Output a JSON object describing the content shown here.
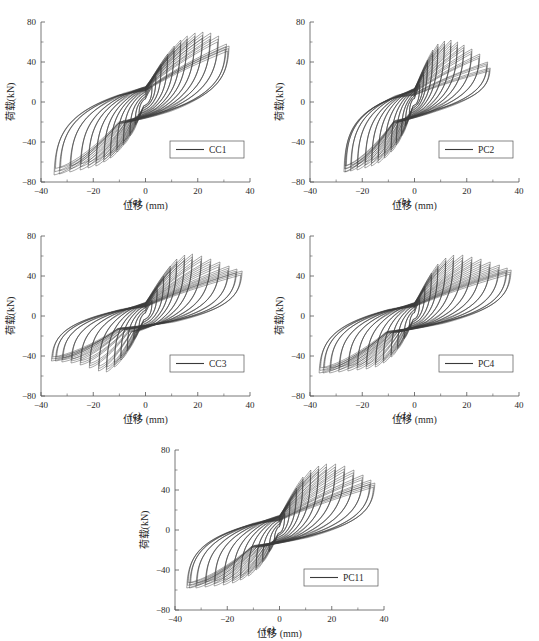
{
  "figure": {
    "background_color": "#ffffff",
    "curve_color": "#3a3a3a",
    "axis_color": "#555555",
    "panel_count": 5
  },
  "panels": [
    {
      "id": "a",
      "caption": "(a)",
      "legend": "CC1"
    },
    {
      "id": "b",
      "caption": "(b)",
      "legend": "PC2"
    },
    {
      "id": "c",
      "caption": "(c)",
      "legend": "CC3"
    },
    {
      "id": "d",
      "caption": "(d )",
      "legend": "PC4"
    },
    {
      "id": "e",
      "caption": "(e)",
      "legend": "PC11"
    }
  ],
  "chart_data": [
    {
      "type": "line",
      "title": "",
      "subtitle": "",
      "panel": "a",
      "legend_entries": [
        "CC1"
      ],
      "legend_position": "lower-right",
      "grid": false,
      "xlabel": "位移 (mm)",
      "ylabel": "荷载(kN)",
      "xlim": [
        -40,
        40
      ],
      "ylim": [
        -80,
        80
      ],
      "xticks": [
        -40,
        -20,
        0,
        20,
        40
      ],
      "yticks": [
        -80,
        -40,
        0,
        40,
        80
      ],
      "xtick_labels": [
        "-40",
        "-20",
        "0",
        "20",
        "40"
      ],
      "ytick_labels": [
        "-80",
        "-40",
        "0",
        "40",
        "80"
      ],
      "description": "Pinched hysteresis loops, load vs displacement, cyclic loading",
      "cycles": [
        {
          "peak_disp": 2.5,
          "peak_load": 16,
          "neg_disp": -2.5,
          "neg_load": -14
        },
        {
          "peak_disp": 4.0,
          "peak_load": 26,
          "neg_disp": -4.0,
          "neg_load": -23
        },
        {
          "peak_disp": 6.0,
          "peak_load": 38,
          "neg_disp": -6.0,
          "neg_load": -34
        },
        {
          "peak_disp": 8.5,
          "peak_load": 48,
          "neg_disp": -8.5,
          "neg_load": -43
        },
        {
          "peak_disp": 11.0,
          "peak_load": 56,
          "neg_disp": -11.0,
          "neg_load": -50
        },
        {
          "peak_disp": 13.5,
          "peak_load": 62,
          "neg_disp": -13.5,
          "neg_load": -56
        },
        {
          "peak_disp": 16.0,
          "peak_load": 66,
          "neg_disp": -16.0,
          "neg_load": -60
        },
        {
          "peak_disp": 19.0,
          "peak_load": 69,
          "neg_disp": -19.0,
          "neg_load": -64
        },
        {
          "peak_disp": 22.0,
          "peak_load": 70,
          "neg_disp": -22.0,
          "neg_load": -66
        },
        {
          "peak_disp": 25.0,
          "peak_load": 69,
          "neg_disp": -25.0,
          "neg_load": -68
        },
        {
          "peak_disp": 28.0,
          "peak_load": 66,
          "neg_disp": -29.0,
          "neg_load": -70
        },
        {
          "peak_disp": 31.0,
          "peak_load": 58,
          "neg_disp": -33.0,
          "neg_load": -72
        },
        {
          "peak_disp": 32.0,
          "peak_load": 56,
          "neg_disp": -35.0,
          "neg_load": -73
        }
      ],
      "max_positive_load": 70,
      "max_negative_load": -73,
      "max_positive_disp": 32,
      "max_negative_disp": -35
    },
    {
      "type": "line",
      "title": "",
      "panel": "b",
      "legend_entries": [
        "PC2"
      ],
      "legend_position": "lower-right",
      "grid": false,
      "xlabel": "位移 (mm)",
      "ylabel": "荷载(kN)",
      "xlim": [
        -40,
        40
      ],
      "ylim": [
        -80,
        80
      ],
      "xticks": [
        -40,
        -20,
        0,
        20,
        40
      ],
      "yticks": [
        -80,
        -40,
        0,
        40,
        80
      ],
      "xtick_labels": [
        "-40",
        "-20",
        "0",
        "20",
        "40"
      ],
      "ytick_labels": [
        "-80",
        "-40",
        "0",
        "40",
        "80"
      ],
      "description": "Pinched hysteresis loops, load vs displacement, cyclic loading",
      "cycles": [
        {
          "peak_disp": 2.0,
          "peak_load": 18,
          "neg_disp": -2.0,
          "neg_load": -14
        },
        {
          "peak_disp": 3.5,
          "peak_load": 30,
          "neg_disp": -3.5,
          "neg_load": -24
        },
        {
          "peak_disp": 5.0,
          "peak_load": 42,
          "neg_disp": -5.0,
          "neg_load": -34
        },
        {
          "peak_disp": 7.0,
          "peak_load": 52,
          "neg_disp": -7.0,
          "neg_load": -43
        },
        {
          "peak_disp": 9.0,
          "peak_load": 58,
          "neg_disp": -9.0,
          "neg_load": -50
        },
        {
          "peak_disp": 11.5,
          "peak_load": 61,
          "neg_disp": -11.5,
          "neg_load": -56
        },
        {
          "peak_disp": 14.0,
          "peak_load": 62,
          "neg_disp": -14.0,
          "neg_load": -61
        },
        {
          "peak_disp": 16.5,
          "peak_load": 60,
          "neg_disp": -16.5,
          "neg_load": -64
        },
        {
          "peak_disp": 19.0,
          "peak_load": 57,
          "neg_disp": -19.0,
          "neg_load": -66
        },
        {
          "peak_disp": 22.0,
          "peak_load": 53,
          "neg_disp": -22.0,
          "neg_load": -68
        },
        {
          "peak_disp": 25.0,
          "peak_load": 48,
          "neg_disp": -24.5,
          "neg_load": -69
        },
        {
          "peak_disp": 28.0,
          "peak_load": 40,
          "neg_disp": -26.5,
          "neg_load": -70
        },
        {
          "peak_disp": 29.0,
          "peak_load": 34,
          "neg_disp": -27.0,
          "neg_load": -70
        }
      ],
      "max_positive_load": 62,
      "max_negative_load": -70,
      "max_positive_disp": 29,
      "max_negative_disp": -27
    },
    {
      "type": "line",
      "title": "",
      "panel": "c",
      "legend_entries": [
        "CC3"
      ],
      "legend_position": "lower-right",
      "grid": false,
      "xlabel": "位移 (mm)",
      "ylabel": "荷载(kN)",
      "xlim": [
        -40,
        40
      ],
      "ylim": [
        -80,
        80
      ],
      "xticks": [
        -40,
        -20,
        0,
        20,
        40
      ],
      "yticks": [
        -80,
        -40,
        0,
        40,
        80
      ],
      "xtick_labels": [
        "-40",
        "-20",
        "0",
        "20",
        "40"
      ],
      "ytick_labels": [
        "-80",
        "-40",
        "0",
        "40",
        "80"
      ],
      "description": "Pinched hysteresis loops, load vs displacement, cyclic loading",
      "cycles": [
        {
          "peak_disp": 2.5,
          "peak_load": 16,
          "neg_disp": -2.5,
          "neg_load": -14
        },
        {
          "peak_disp": 4.5,
          "peak_load": 28,
          "neg_disp": -4.5,
          "neg_load": -24
        },
        {
          "peak_disp": 7.0,
          "peak_load": 40,
          "neg_disp": -7.0,
          "neg_load": -35
        },
        {
          "peak_disp": 9.5,
          "peak_load": 50,
          "neg_disp": -9.5,
          "neg_load": -44
        },
        {
          "peak_disp": 12.0,
          "peak_load": 57,
          "neg_disp": -12.0,
          "neg_load": -51
        },
        {
          "peak_disp": 15.0,
          "peak_load": 61,
          "neg_disp": -15.0,
          "neg_load": -56
        },
        {
          "peak_disp": 18.0,
          "peak_load": 62,
          "neg_disp": -18.0,
          "neg_load": -55
        },
        {
          "peak_disp": 21.5,
          "peak_load": 60,
          "neg_disp": -21.5,
          "neg_load": -52
        },
        {
          "peak_disp": 25.0,
          "peak_load": 57,
          "neg_disp": -25.0,
          "neg_load": -49
        },
        {
          "peak_disp": 28.5,
          "peak_load": 54,
          "neg_disp": -28.5,
          "neg_load": -47
        },
        {
          "peak_disp": 32.0,
          "peak_load": 50,
          "neg_disp": -32.0,
          "neg_load": -46
        },
        {
          "peak_disp": 35.0,
          "peak_load": 47,
          "neg_disp": -34.5,
          "neg_load": -45
        },
        {
          "peak_disp": 37.0,
          "peak_load": 45,
          "neg_disp": -36.0,
          "neg_load": -45
        }
      ],
      "max_positive_load": 62,
      "max_negative_load": -56,
      "max_positive_disp": 37,
      "max_negative_disp": -36
    },
    {
      "type": "line",
      "title": "",
      "panel": "d",
      "legend_entries": [
        "PC4"
      ],
      "legend_position": "lower-right",
      "grid": false,
      "xlabel": "位移 (mm)",
      "ylabel": "荷载(kN)",
      "xlim": [
        -40,
        40
      ],
      "ylim": [
        -80,
        80
      ],
      "xticks": [
        -40,
        -20,
        0,
        20,
        40
      ],
      "yticks": [
        -80,
        -40,
        0,
        40,
        80
      ],
      "xtick_labels": [
        "-40",
        "-20",
        "0",
        "20",
        "40"
      ],
      "ytick_labels": [
        "-80",
        "-40",
        "0",
        "40",
        "80"
      ],
      "description": "Pinched hysteresis loops, load vs displacement, cyclic loading",
      "cycles": [
        {
          "peak_disp": 2.0,
          "peak_load": 17,
          "neg_disp": -2.0,
          "neg_load": -13
        },
        {
          "peak_disp": 4.0,
          "peak_load": 30,
          "neg_disp": -4.0,
          "neg_load": -23
        },
        {
          "peak_disp": 6.5,
          "peak_load": 43,
          "neg_disp": -6.5,
          "neg_load": -33
        },
        {
          "peak_disp": 9.0,
          "peak_load": 52,
          "neg_disp": -9.0,
          "neg_load": -41
        },
        {
          "peak_disp": 12.0,
          "peak_load": 58,
          "neg_disp": -12.0,
          "neg_load": -47
        },
        {
          "peak_disp": 15.0,
          "peak_load": 61,
          "neg_disp": -15.0,
          "neg_load": -51
        },
        {
          "peak_disp": 18.5,
          "peak_load": 61,
          "neg_disp": -18.5,
          "neg_load": -53
        },
        {
          "peak_disp": 22.0,
          "peak_load": 59,
          "neg_disp": -22.0,
          "neg_load": -54
        },
        {
          "peak_disp": 25.5,
          "peak_load": 57,
          "neg_disp": -25.5,
          "neg_load": -55
        },
        {
          "peak_disp": 29.0,
          "peak_load": 54,
          "neg_disp": -29.0,
          "neg_load": -56
        },
        {
          "peak_disp": 32.5,
          "peak_load": 51,
          "neg_disp": -32.5,
          "neg_load": -57
        },
        {
          "peak_disp": 35.5,
          "peak_load": 48,
          "neg_disp": -35.0,
          "neg_load": -57
        },
        {
          "peak_disp": 37.0,
          "peak_load": 46,
          "neg_disp": -36.5,
          "neg_load": -57
        }
      ],
      "max_positive_load": 61,
      "max_negative_load": -57,
      "max_positive_disp": 37,
      "max_negative_disp": -36.5
    },
    {
      "type": "line",
      "title": "",
      "panel": "e",
      "legend_entries": [
        "PC11"
      ],
      "legend_position": "lower-right",
      "grid": false,
      "xlabel": "位移 (mm)",
      "ylabel": "荷载(kN)",
      "xlim": [
        -40,
        40
      ],
      "ylim": [
        -80,
        80
      ],
      "xticks": [
        -40,
        -20,
        0,
        20,
        40
      ],
      "yticks": [
        -80,
        -40,
        0,
        40,
        80
      ],
      "xtick_labels": [
        "-40",
        "-20",
        "0",
        "20",
        "40"
      ],
      "ytick_labels": [
        "-80",
        "-40",
        "0",
        "40",
        "80"
      ],
      "description": "Pinched hysteresis loops, load vs displacement, cyclic loading",
      "cycles": [
        {
          "peak_disp": 2.0,
          "peak_load": 17,
          "neg_disp": -2.0,
          "neg_load": -13
        },
        {
          "peak_disp": 4.0,
          "peak_load": 29,
          "neg_disp": -4.0,
          "neg_load": -22
        },
        {
          "peak_disp": 6.5,
          "peak_load": 42,
          "neg_disp": -6.5,
          "neg_load": -32
        },
        {
          "peak_disp": 9.0,
          "peak_load": 53,
          "neg_disp": -9.0,
          "neg_load": -40
        },
        {
          "peak_disp": 12.0,
          "peak_load": 60,
          "neg_disp": -12.0,
          "neg_load": -46
        },
        {
          "peak_disp": 15.0,
          "peak_load": 64,
          "neg_disp": -15.0,
          "neg_load": -50
        },
        {
          "peak_disp": 18.0,
          "peak_load": 66,
          "neg_disp": -18.0,
          "neg_load": -53
        },
        {
          "peak_disp": 21.5,
          "peak_load": 66,
          "neg_disp": -21.5,
          "neg_load": -55
        },
        {
          "peak_disp": 25.0,
          "peak_load": 64,
          "neg_disp": -25.0,
          "neg_load": -56
        },
        {
          "peak_disp": 28.5,
          "peak_load": 60,
          "neg_disp": -28.5,
          "neg_load": -57
        },
        {
          "peak_disp": 32.0,
          "peak_load": 55,
          "neg_disp": -32.0,
          "neg_load": -58
        },
        {
          "peak_disp": 35.0,
          "peak_load": 50,
          "neg_disp": -34.5,
          "neg_load": -58
        },
        {
          "peak_disp": 36.5,
          "peak_load": 47,
          "neg_disp": -35.5,
          "neg_load": -58
        }
      ],
      "max_positive_load": 66,
      "max_negative_load": -58,
      "max_positive_disp": 36.5,
      "max_negative_disp": -35.5
    }
  ]
}
